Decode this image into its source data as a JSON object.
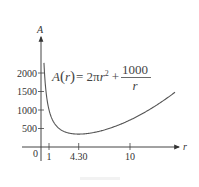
{
  "chart_data": {
    "type": "line",
    "title": "",
    "function_label": "A(r) = 2πr² + 1000/r",
    "formula": {
      "lhs": "A",
      "arg": "r",
      "rhs_term1": "= 2π",
      "rhs_var": "r",
      "rhs_exp": "2",
      "plus": "+",
      "numerator": "1000",
      "denominator": "r"
    },
    "xlabel": "r",
    "ylabel": "A",
    "x_ticks": [
      {
        "value": 1,
        "label": "1"
      },
      {
        "value": 4.3,
        "label": "4.30"
      },
      {
        "value": 10,
        "label": "10"
      }
    ],
    "y_ticks": [
      {
        "value": 500,
        "label": "500"
      },
      {
        "value": 1000,
        "label": "1000"
      },
      {
        "value": 1500,
        "label": "1500"
      },
      {
        "value": 2000,
        "label": "2000"
      }
    ],
    "origin_label": "0",
    "xlim": [
      0,
      15
    ],
    "ylim": [
      0,
      2300
    ],
    "grid": false,
    "legend": "none",
    "minimum": {
      "r": 4.3,
      "A": 348.7
    },
    "series": [
      {
        "name": "A(r)",
        "x": [
          0.44,
          0.5,
          0.6,
          0.8,
          1,
          1.5,
          2,
          2.5,
          3,
          3.5,
          4,
          4.3,
          5,
          6,
          7,
          8,
          9,
          10,
          11,
          12,
          13,
          14,
          15
        ],
        "values": [
          2274,
          2002,
          1669,
          1254,
          1006,
          681,
          525,
          439,
          390,
          363,
          351,
          349,
          357,
          393,
          451,
          527,
          620,
          728,
          851,
          988,
          1139,
          1303,
          1480
        ]
      }
    ]
  }
}
